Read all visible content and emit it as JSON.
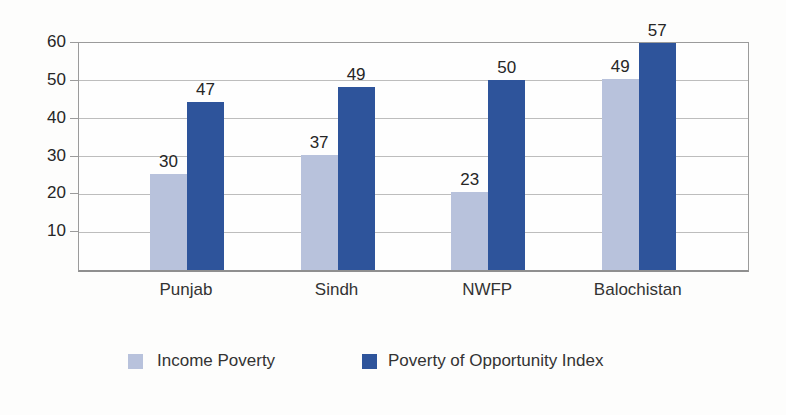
{
  "chart_data": {
    "type": "bar",
    "title": "",
    "xlabel": "",
    "ylabel": "",
    "categories": [
      "Punjab",
      "Sindh",
      "NWFP",
      "Balochistan"
    ],
    "series": [
      {
        "name": "Income Poverty",
        "color": "#b8c2dc",
        "values": [
          30,
          37,
          23,
          49
        ],
        "drawn_bar_heights": [
          25.5,
          30.5,
          20.5,
          50.5
        ]
      },
      {
        "name": "Poverty of Opportunity Index",
        "color": "#2e549b",
        "values": [
          47,
          49,
          50,
          57
        ],
        "drawn_bar_heights": [
          44.5,
          48.3,
          50.3,
          60
        ]
      }
    ],
    "ylim": [
      0,
      60
    ],
    "yticks": [
      10,
      20,
      30,
      40,
      50,
      60
    ],
    "grid": true,
    "value_labels_shown": true,
    "legend_position": "bottom"
  },
  "colors": {
    "grid": "#bdbdbd",
    "plot_border": "#9b9b9b",
    "text": "#2b2b2b",
    "background": "#fdfdfc"
  }
}
